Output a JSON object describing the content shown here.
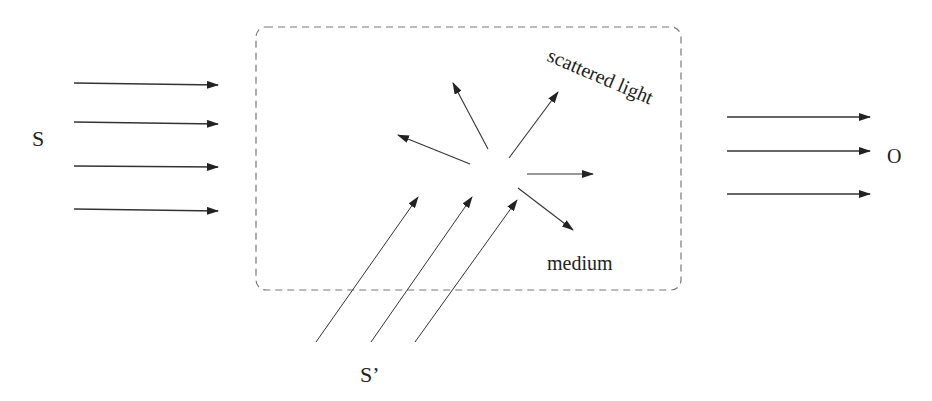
{
  "diagram": {
    "labels": {
      "source": "S",
      "second_source": "S’",
      "observer": "O",
      "medium": "medium",
      "scattered": "scattered light"
    },
    "colors": {
      "stroke": "#333333",
      "box_stroke": "#777777",
      "background": "#ffffff"
    },
    "medium_box": {
      "x": 256,
      "y": 27,
      "width": 425,
      "height": 263,
      "style": "dashed",
      "corner_radius": 10
    },
    "incident_arrows_S": [
      {
        "x1": 74,
        "y1": 83,
        "x2": 218,
        "y2": 85
      },
      {
        "x1": 74,
        "y1": 122,
        "x2": 218,
        "y2": 124
      },
      {
        "x1": 74,
        "y1": 166,
        "x2": 218,
        "y2": 167
      },
      {
        "x1": 74,
        "y1": 209,
        "x2": 218,
        "y2": 211
      }
    ],
    "incident_arrows_Sprime": [
      {
        "x1": 316,
        "y1": 342,
        "x2": 418,
        "y2": 197
      },
      {
        "x1": 371,
        "y1": 342,
        "x2": 472,
        "y2": 197
      },
      {
        "x1": 415,
        "y1": 342,
        "x2": 517,
        "y2": 200
      }
    ],
    "scattered_arrows": [
      {
        "x1": 470,
        "y1": 164,
        "x2": 398,
        "y2": 135
      },
      {
        "x1": 488,
        "y1": 149,
        "x2": 453,
        "y2": 83
      },
      {
        "x1": 509,
        "y1": 158,
        "x2": 558,
        "y2": 92
      },
      {
        "x1": 527,
        "y1": 174,
        "x2": 593,
        "y2": 174
      },
      {
        "x1": 518,
        "y1": 188,
        "x2": 573,
        "y2": 230
      }
    ],
    "outgoing_arrows_O": [
      {
        "x1": 727,
        "y1": 117,
        "x2": 870,
        "y2": 117
      },
      {
        "x1": 727,
        "y1": 151,
        "x2": 870,
        "y2": 151
      },
      {
        "x1": 727,
        "y1": 194,
        "x2": 870,
        "y2": 194
      }
    ]
  }
}
